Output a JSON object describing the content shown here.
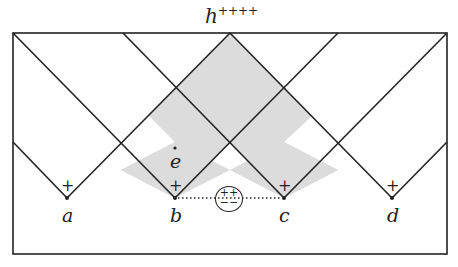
{
  "title": {
    "base": "h",
    "sup": "++++"
  },
  "points": [
    {
      "label": "a",
      "x": 67,
      "y": 198,
      "mark": "+"
    },
    {
      "label": "b",
      "x": 175,
      "y": 198,
      "mark": "+"
    },
    {
      "label": "c",
      "x": 284,
      "y": 198,
      "mark": "+"
    },
    {
      "label": "d",
      "x": 392,
      "y": 198,
      "mark": "+"
    }
  ],
  "e_label": "e",
  "circle": {
    "top": "++",
    "bottom": "−−"
  },
  "colors": {
    "line": "#222222",
    "shade": "#dcdcdc"
  }
}
